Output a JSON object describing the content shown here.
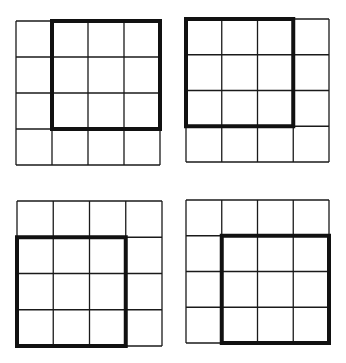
{
  "diagram": {
    "line_color": "#1a1a1a",
    "thick_color": "#111111",
    "grids": [
      {
        "id": "top-left",
        "x": 16,
        "y": 21,
        "size": 144,
        "rows": 4,
        "cols": 4,
        "highlight": {
          "row": 0,
          "col": 1,
          "rows": 3,
          "cols": 3
        },
        "highlight_corner": "top-right"
      },
      {
        "id": "top-right",
        "x": 186,
        "y": 19,
        "size": 143,
        "rows": 4,
        "cols": 4,
        "highlight": {
          "row": 0,
          "col": 0,
          "rows": 3,
          "cols": 3
        },
        "highlight_corner": "top-left"
      },
      {
        "id": "bottom-left",
        "x": 17,
        "y": 201,
        "size": 145,
        "rows": 4,
        "cols": 4,
        "highlight": {
          "row": 1,
          "col": 0,
          "rows": 3,
          "cols": 3
        },
        "highlight_corner": "bottom-left"
      },
      {
        "id": "bottom-right",
        "x": 186,
        "y": 200,
        "size": 143,
        "rows": 4,
        "cols": 4,
        "highlight": {
          "row": 1,
          "col": 1,
          "rows": 3,
          "cols": 3
        },
        "highlight_corner": "bottom-right"
      }
    ]
  }
}
